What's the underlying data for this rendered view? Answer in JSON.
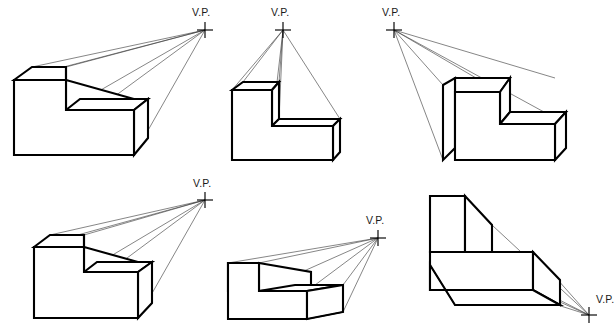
{
  "page": {
    "background_color": "#ffffff",
    "line_color": "#000000",
    "ray_color": "#3a3a3a",
    "width": 616,
    "height": 331
  },
  "labels": {
    "vanishing_point": "V.P."
  },
  "figures": [
    {
      "id": "figure-1",
      "caption": "V.P.",
      "vp_position": "upper-right, far",
      "vp_point": {
        "x": 205,
        "y": 30
      },
      "label_point": {
        "x": 192,
        "y": 16
      },
      "object_type": "L-shaped block",
      "view": "below eye level, object left of V.P.",
      "ray_count": 5
    },
    {
      "id": "figure-2",
      "caption": "V.P.",
      "vp_position": "directly above object, centered",
      "vp_point": {
        "x": 283,
        "y": 30
      },
      "label_point": {
        "x": 271,
        "y": 16
      },
      "object_type": "L-shaped block",
      "view": "below eye level, object centered under V.P.",
      "ray_count": 5
    },
    {
      "id": "figure-3",
      "caption": "V.P.",
      "vp_position": "upper-left",
      "vp_point": {
        "x": 394,
        "y": 30
      },
      "label_point": {
        "x": 382,
        "y": 16
      },
      "object_type": "L-shaped block, mirrored",
      "view": "below eye level, object right of V.P.",
      "ray_count": 4
    },
    {
      "id": "figure-4",
      "caption": "V.P.",
      "vp_position": "upper-right, near",
      "vp_point": {
        "x": 205,
        "y": 200
      },
      "label_point": {
        "x": 193,
        "y": 187
      },
      "object_type": "L-shaped block",
      "view": "below eye level, object left of V.P.",
      "ray_count": 5
    },
    {
      "id": "figure-5",
      "caption": "V.P.",
      "vp_position": "right, at eye level",
      "vp_point": {
        "x": 378,
        "y": 238
      },
      "label_point": {
        "x": 366,
        "y": 224
      },
      "object_type": "L-shaped block",
      "view": "eye level near top face, object left of V.P.",
      "ray_count": 5
    },
    {
      "id": "figure-6",
      "caption": "V.P.",
      "vp_position": "lower-right, below object",
      "vp_point": {
        "x": 589,
        "y": 315
      },
      "label_point": {
        "x": 596,
        "y": 303
      },
      "object_type": "L-shaped block",
      "view": "above eye level (bird's eye), object upper-left of V.P.",
      "ray_count": 4
    }
  ]
}
